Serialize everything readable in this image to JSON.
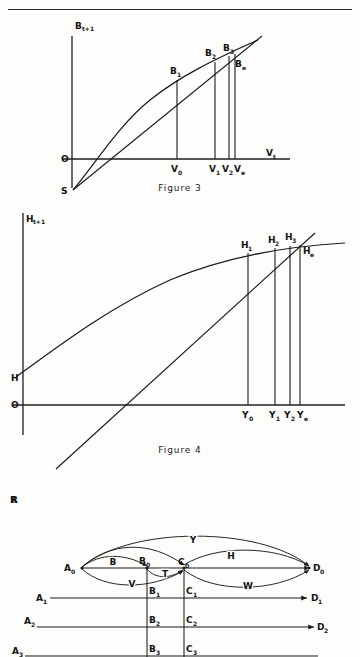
{
  "page": {
    "running_head": "ECONOMIC MODELS",
    "width": 360,
    "height": 657,
    "background": "#fdfdfb",
    "ink": "#1b1b1b"
  },
  "figure3": {
    "caption": "Figure  3",
    "y_axis_label": "B",
    "y_axis_sub": "t+1",
    "x_axis_label": "V",
    "x_axis_sub": "t",
    "origin_label": "O",
    "intercept_label": "S",
    "curve_points": [
      {
        "label": "B",
        "sub": "1",
        "x": 177,
        "y": 62
      },
      {
        "label": "B",
        "sub": "2",
        "x": 215,
        "y": 45
      },
      {
        "label": "B",
        "sub": "3",
        "x": 231,
        "y": 40
      },
      {
        "label": "B",
        "sub": "e",
        "x": 238,
        "y": 55
      }
    ],
    "x_ticks": [
      {
        "label": "V",
        "sub": "0",
        "x": 177
      },
      {
        "label": "V",
        "sub": "1",
        "x": 215
      },
      {
        "label": "V",
        "sub": "2",
        "x": 231
      },
      {
        "label": "V",
        "sub": "e",
        "x": 240
      }
    ]
  },
  "figure4": {
    "caption": "Figure  4",
    "y_axis_label": "H",
    "y_axis_sub": "t+1",
    "origin_label": "O",
    "intercept_label": "H",
    "lower_intercept_label": "R",
    "curve_points": [
      {
        "label": "H",
        "sub": "1",
        "x": 248,
        "y": 245
      },
      {
        "label": "H",
        "sub": "2",
        "x": 275,
        "y": 238
      },
      {
        "label": "H",
        "sub": "3",
        "x": 293,
        "y": 235
      },
      {
        "label": "H",
        "sub": "e",
        "x": 306,
        "y": 247
      }
    ],
    "x_ticks": [
      {
        "label": "Y",
        "sub": "0",
        "x": 248
      },
      {
        "label": "Y",
        "sub": "1",
        "x": 275
      },
      {
        "label": "Y",
        "sub": "2",
        "x": 293
      },
      {
        "label": "Y",
        "sub": "e",
        "x": 304
      }
    ]
  },
  "figure5": {
    "nodes": [
      {
        "label": "A",
        "sub": "0"
      },
      {
        "label": "B",
        "sub": "0"
      },
      {
        "label": "C",
        "sub": "0"
      },
      {
        "label": "D",
        "sub": "0"
      }
    ],
    "arc_labels": [
      "Y",
      "H",
      "B",
      "V",
      "T",
      "W"
    ],
    "rows": [
      {
        "left": {
          "label": "A",
          "sub": "1"
        },
        "mid1": {
          "label": "B",
          "sub": "1"
        },
        "mid2": {
          "label": "C",
          "sub": "1"
        },
        "right": {
          "label": "D",
          "sub": "1"
        }
      },
      {
        "left": {
          "label": "A",
          "sub": "2"
        },
        "mid1": {
          "label": "B",
          "sub": "2"
        },
        "mid2": {
          "label": "C",
          "sub": "2"
        },
        "right": {
          "label": "D",
          "sub": "2"
        }
      },
      {
        "left": {
          "label": "A",
          "sub": "3"
        },
        "mid1": {
          "label": "B",
          "sub": "3"
        },
        "mid2": {
          "label": "C",
          "sub": "3"
        },
        "right": {
          "label": "D",
          "sub": "3"
        }
      }
    ]
  }
}
